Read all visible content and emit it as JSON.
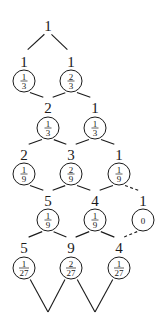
{
  "diagram": {
    "type": "lattice-tree",
    "root": {
      "count": "1",
      "col": 1,
      "row": 0
    },
    "nodes": [
      {
        "id": "r1c0",
        "row": 1,
        "col": 0,
        "count": "1",
        "prob_num": "1",
        "prob_den": "3"
      },
      {
        "id": "r1c2",
        "row": 1,
        "col": 2,
        "count": "1",
        "prob_num": "2",
        "prob_den": "3"
      },
      {
        "id": "r2c1",
        "row": 2,
        "col": 1,
        "count": "2",
        "prob_num": "1",
        "prob_den": "3"
      },
      {
        "id": "r2c3",
        "row": 2,
        "col": 3,
        "count": "1",
        "prob_num": "1",
        "prob_den": "3"
      },
      {
        "id": "r3c0",
        "row": 3,
        "col": 0,
        "count": "2",
        "prob_num": "1",
        "prob_den": "9"
      },
      {
        "id": "r3c2",
        "row": 3,
        "col": 2,
        "count": "3",
        "prob_num": "2",
        "prob_den": "9"
      },
      {
        "id": "r3c4",
        "row": 3,
        "col": 4,
        "count": "1",
        "prob_num": "1",
        "prob_den": "9"
      },
      {
        "id": "r4c1",
        "row": 4,
        "col": 1,
        "count": "5",
        "prob_num": "1",
        "prob_den": "9"
      },
      {
        "id": "r4c3",
        "row": 4,
        "col": 3,
        "count": "4",
        "prob_num": "1",
        "prob_den": "9"
      },
      {
        "id": "r4c5",
        "row": 4,
        "col": 5,
        "count": "1",
        "prob_value": "0"
      },
      {
        "id": "r5c0",
        "row": 5,
        "col": 0,
        "count": "5",
        "prob_num": "1",
        "prob_den": "27"
      },
      {
        "id": "r5c2",
        "row": 5,
        "col": 2,
        "count": "9",
        "prob_num": "2",
        "prob_den": "27"
      },
      {
        "id": "r5c4",
        "row": 5,
        "col": 4,
        "count": "4",
        "prob_num": "1",
        "prob_den": "27"
      }
    ],
    "edges": [
      {
        "from": "root",
        "to": "r1c0",
        "style": "solid"
      },
      {
        "from": "root",
        "to": "r1c2",
        "style": "solid"
      },
      {
        "from": "r1c0",
        "to": "r2c1",
        "style": "solid"
      },
      {
        "from": "r1c2",
        "to": "r2c1",
        "style": "solid"
      },
      {
        "from": "r1c2",
        "to": "r2c3",
        "style": "solid"
      },
      {
        "from": "r2c1",
        "to": "r3c0",
        "style": "solid"
      },
      {
        "from": "r2c1",
        "to": "r3c2",
        "style": "solid"
      },
      {
        "from": "r2c3",
        "to": "r3c2",
        "style": "solid"
      },
      {
        "from": "r2c3",
        "to": "r3c4",
        "style": "solid"
      },
      {
        "from": "r3c0",
        "to": "r4c1",
        "style": "solid"
      },
      {
        "from": "r3c2",
        "to": "r4c1",
        "style": "solid"
      },
      {
        "from": "r3c2",
        "to": "r4c3",
        "style": "solid"
      },
      {
        "from": "r3c4",
        "to": "r4c3",
        "style": "solid"
      },
      {
        "from": "r3c4",
        "to": "r4c5",
        "style": "dashed"
      },
      {
        "from": "r4c1",
        "to": "r5c0",
        "style": "solid"
      },
      {
        "from": "r4c1",
        "to": "r5c2",
        "style": "solid"
      },
      {
        "from": "r4c3",
        "to": "r5c2",
        "style": "solid"
      },
      {
        "from": "r4c3",
        "to": "r5c4",
        "style": "solid"
      },
      {
        "from": "r4c5",
        "to": "r5c4",
        "style": "dashed"
      },
      {
        "from": "r5c0",
        "to": "open-bottom-1",
        "style": "solid"
      },
      {
        "from": "r5c2",
        "to": "open-bottom-1",
        "style": "solid"
      },
      {
        "from": "r5c2",
        "to": "open-bottom-3",
        "style": "solid"
      },
      {
        "from": "r5c4",
        "to": "open-bottom-3",
        "style": "solid"
      }
    ],
    "colors": {
      "stroke": "#1a1a1a",
      "background": "#ffffff"
    }
  }
}
